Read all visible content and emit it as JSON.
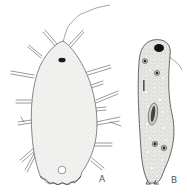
{
  "figure": {
    "panels": [
      {
        "id": "A",
        "label": "A",
        "description": "Protozoan with radiating pseudopodia/spines, dark anterior nucleus, flagellum, posterior vacuole"
      },
      {
        "id": "B",
        "label": "B",
        "description": "Elongated ciliate-like protozoan with vacuoles, food particles, flagellum"
      }
    ],
    "colors": {
      "outline": "#555555",
      "cytoplasm_a": "#f1f1ef",
      "cytoplasm_b": "#e4e4e0",
      "nucleus": "#1a1a1a",
      "stipple": "#c4c4c0"
    }
  }
}
